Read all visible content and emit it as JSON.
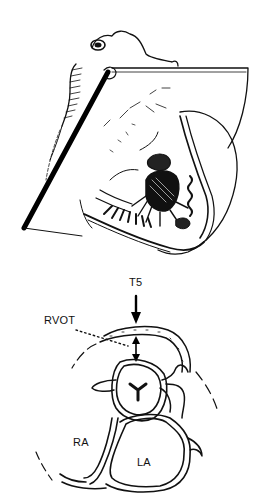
{
  "figure": {
    "top_panel": {
      "description": "Heart specimen cut by an oblique imaging plane"
    },
    "bottom_panel": {
      "description": "Schematic cross-section at imaging plane",
      "labels": {
        "transducer": "T5",
        "outflow": "RVOT",
        "right_atrium": "RA",
        "left_atrium": "LA"
      }
    }
  },
  "colors": {
    "ink": "#111111",
    "background": "#ffffff"
  }
}
